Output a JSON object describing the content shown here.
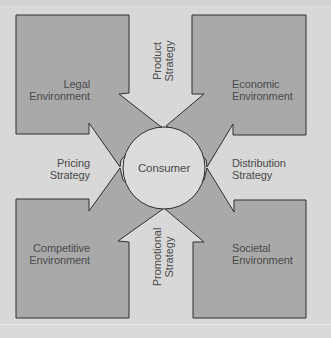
{
  "diagram": {
    "center": {
      "label": "Consumer"
    },
    "environments": [
      {
        "id": "legal",
        "line1": "Legal",
        "line2": "Environment",
        "position": "top-left"
      },
      {
        "id": "economic",
        "line1": "Economic",
        "line2": "Environment",
        "position": "top-right"
      },
      {
        "id": "competitive",
        "line1": "Competitive",
        "line2": "Environment",
        "position": "bottom-left"
      },
      {
        "id": "societal",
        "line1": "Societal",
        "line2": "Environment",
        "position": "bottom-right"
      }
    ],
    "strategies": [
      {
        "id": "product",
        "line1": "Product",
        "line2": "Strategy",
        "position": "top",
        "orientation": "vertical"
      },
      {
        "id": "pricing",
        "line1": "Pricing",
        "line2": "Strategy",
        "position": "left",
        "orientation": "horizontal"
      },
      {
        "id": "distribution",
        "line1": "Distribution",
        "line2": "Strategy",
        "position": "right",
        "orientation": "horizontal"
      },
      {
        "id": "promotional",
        "line1": "Promotional",
        "line2": "Strategy",
        "position": "bottom",
        "orientation": "vertical"
      }
    ],
    "colors": {
      "background": "#d8d8d8",
      "box_fill": "#a9a9a9",
      "circle_fill": "#dcdcdc",
      "outline": "#2e2e2e",
      "text": "#4a4a4a"
    }
  }
}
